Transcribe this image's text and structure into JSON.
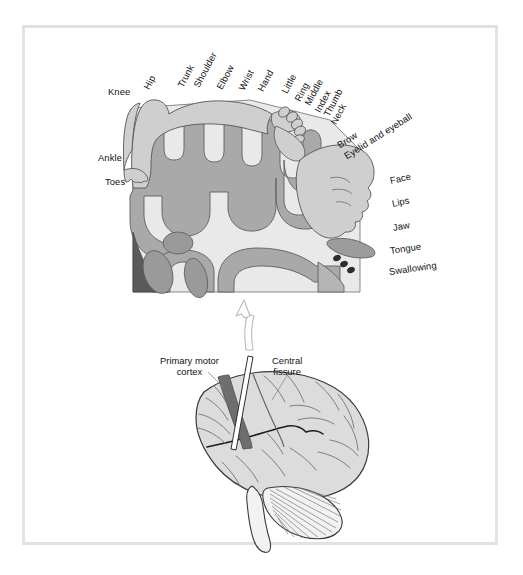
{
  "figure": {
    "panels": [
      {
        "id": "homunculus-panel",
        "name": "Motor homunculus cross-section of precentral gyrus"
      },
      {
        "id": "brain-panel",
        "name": "Lateral view of the human brain"
      }
    ]
  },
  "homunculus": {
    "labels": [
      {
        "text": "Knee",
        "x": 108,
        "y": 87,
        "rot": 0,
        "size": "big"
      },
      {
        "text": "Hip",
        "x": 146,
        "y": 84,
        "rot": -62,
        "size": "big"
      },
      {
        "text": "Trunk",
        "x": 180,
        "y": 82,
        "rot": -62,
        "size": "big"
      },
      {
        "text": "Shoulder",
        "x": 196,
        "y": 82,
        "rot": -62,
        "size": "big"
      },
      {
        "text": "Elbow",
        "x": 219,
        "y": 84,
        "rot": -62,
        "size": "big"
      },
      {
        "text": "Wrist",
        "x": 241,
        "y": 85,
        "rot": -62,
        "size": "big"
      },
      {
        "text": "Hand",
        "x": 260,
        "y": 86,
        "rot": -62,
        "size": "big"
      },
      {
        "text": "Little",
        "x": 284,
        "y": 88,
        "rot": -62,
        "size": "big"
      },
      {
        "text": "Ring",
        "x": 297,
        "y": 96,
        "rot": -62,
        "size": "big"
      },
      {
        "text": "Middle",
        "x": 307,
        "y": 100,
        "rot": -62,
        "size": "big"
      },
      {
        "text": "Index",
        "x": 317,
        "y": 107,
        "rot": -62,
        "size": "big"
      },
      {
        "text": "Thumb",
        "x": 326,
        "y": 111,
        "rot": -62,
        "size": "big"
      },
      {
        "text": "Neck",
        "x": 333,
        "y": 119,
        "rot": -62,
        "size": "big"
      },
      {
        "text": "Brow",
        "x": 338,
        "y": 141,
        "rot": -32,
        "size": "big"
      },
      {
        "text": "Eyelid and eyeball",
        "x": 345,
        "y": 152,
        "rot": -32,
        "size": "big"
      },
      {
        "text": "Ankle",
        "x": 98,
        "y": 153,
        "rot": 0,
        "size": "big"
      },
      {
        "text": "Toes",
        "x": 105,
        "y": 177,
        "rot": 0,
        "size": "big"
      },
      {
        "text": "Face",
        "x": 390,
        "y": 176,
        "rot": -12,
        "size": "big"
      },
      {
        "text": "Lips",
        "x": 392,
        "y": 199,
        "rot": -12,
        "size": "big"
      },
      {
        "text": "Jaw",
        "x": 393,
        "y": 223,
        "rot": -10,
        "size": "big"
      },
      {
        "text": "Tongue",
        "x": 390,
        "y": 246,
        "rot": -8,
        "size": "big"
      },
      {
        "text": "Swallowing",
        "x": 389,
        "y": 267,
        "rot": -8,
        "size": "big"
      }
    ]
  },
  "brain": {
    "labels": [
      {
        "id": "primary-motor-cortex",
        "line1": "Primary motor",
        "line2": "cortex",
        "x": 160,
        "y": 355
      },
      {
        "id": "central-fissure",
        "line1": "Central",
        "line2": "fissure",
        "x": 272,
        "y": 355
      }
    ]
  },
  "colors": {
    "frame": "#e2e2e2",
    "page_background": "#ffffff",
    "white_matter": "#e9e9e9",
    "gray_matter": "#a9a9a9",
    "deep_nuclei": "#5a5a5a",
    "homunculus_body": "#cfcfcf",
    "brain_surface": "#dcdcdc",
    "motor_strip": "#6e6e6e",
    "outline": "#4a4a4a",
    "text": "#111111"
  }
}
